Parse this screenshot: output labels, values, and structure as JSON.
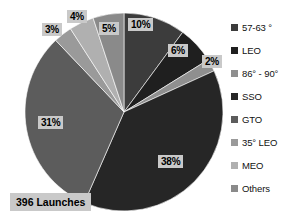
{
  "chart_data": {
    "type": "pie",
    "title": "",
    "subtitle": "",
    "xlabel": "",
    "ylabel": "",
    "grid": false,
    "legend_position": "right",
    "total_label": "396 Launches",
    "units": "percent",
    "categories": [
      "57-63 °",
      "LEO",
      "86° - 90°",
      "SSO",
      "GTO",
      "35° LEO",
      "MEO",
      "Others"
    ],
    "values": [
      10,
      6,
      2,
      38,
      31,
      3,
      4,
      5
    ],
    "data_labels": [
      "10%",
      "6%",
      "2%",
      "38%",
      "31%",
      "3%",
      "4%",
      "5%"
    ],
    "colors": [
      "#3c3c3c",
      "#1f1f1f",
      "#8f8f8f",
      "#262626",
      "#5c5c5c",
      "#9a9a9a",
      "#b0b0b0",
      "#8a8a8a"
    ],
    "slices": [
      {
        "label": "57-63 °",
        "value": 10,
        "data_label": "10%",
        "color": "#3c3c3c"
      },
      {
        "label": "LEO",
        "value": 6,
        "data_label": "6%",
        "color": "#1f1f1f"
      },
      {
        "label": "86° - 90°",
        "value": 2,
        "data_label": "2%",
        "color": "#8f8f8f"
      },
      {
        "label": "SSO",
        "value": 38,
        "data_label": "38%",
        "color": "#262626"
      },
      {
        "label": "GTO",
        "value": 31,
        "data_label": "31%",
        "color": "#5c5c5c"
      },
      {
        "label": "35° LEO",
        "value": 3,
        "data_label": "3%",
        "color": "#9a9a9a"
      },
      {
        "label": "MEO",
        "value": 4,
        "data_label": "4%",
        "color": "#b0b0b0"
      },
      {
        "label": "Others",
        "value": 5,
        "data_label": "5%",
        "color": "#8a8a8a"
      }
    ]
  },
  "legend": {
    "items": [
      {
        "label": "57-63 °",
        "color": "#3c3c3c"
      },
      {
        "label": "LEO",
        "color": "#1f1f1f"
      },
      {
        "label": "86° - 90°",
        "color": "#8f8f8f"
      },
      {
        "label": "SSO",
        "color": "#262626"
      },
      {
        "label": "GTO",
        "color": "#5c5c5c"
      },
      {
        "label": "35° LEO",
        "color": "#9a9a9a"
      },
      {
        "label": "MEO",
        "color": "#b0b0b0"
      },
      {
        "label": "Others",
        "color": "#8a8a8a"
      }
    ]
  },
  "caption": {
    "text": "396 Launches"
  },
  "labels": {
    "pct_57_63": "10%",
    "pct_leo": "6%",
    "pct_86_90": "2%",
    "pct_sso": "38%",
    "pct_gto": "31%",
    "pct_35_leo": "3%",
    "pct_meo": "4%",
    "pct_others": "5%"
  },
  "style": {
    "label_background": "#c9c9c9",
    "page_background": "#ffffff",
    "text_color": "#111111"
  }
}
